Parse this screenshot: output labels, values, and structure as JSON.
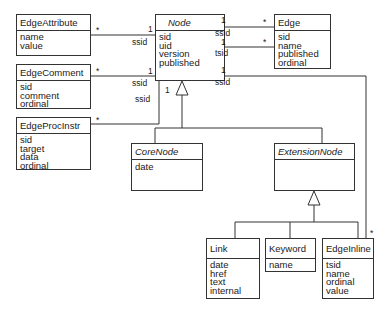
{
  "diagram": {
    "type": "uml-class-diagram",
    "classes": [
      {
        "id": "EdgeAttribute",
        "name": "EdgeAttribute",
        "abstract": false,
        "attributes": [
          "name",
          "value"
        ]
      },
      {
        "id": "EdgeComment",
        "name": "EdgeComment",
        "abstract": false,
        "attributes": [
          "sid",
          "comment",
          "ordinal"
        ]
      },
      {
        "id": "EdgeProcInstr",
        "name": "EdgeProcInstr",
        "abstract": false,
        "attributes": [
          "sid",
          "target",
          "data",
          "ordinal"
        ]
      },
      {
        "id": "Node",
        "name": "Node",
        "abstract": true,
        "attributes": [
          "sid",
          "uid",
          "version",
          "published"
        ]
      },
      {
        "id": "Edge",
        "name": "Edge",
        "abstract": false,
        "attributes": [
          "sid",
          "name",
          "published",
          "ordinal"
        ]
      },
      {
        "id": "CoreNode",
        "name": "CoreNode",
        "abstract": true,
        "attributes": [
          "date"
        ]
      },
      {
        "id": "ExtensionNode",
        "name": "ExtensionNode",
        "abstract": true,
        "attributes": []
      },
      {
        "id": "Link",
        "name": "Link",
        "abstract": false,
        "attributes": [
          "date",
          "href",
          "text",
          "internal"
        ]
      },
      {
        "id": "Keyword",
        "name": "Keyword",
        "abstract": false,
        "attributes": [
          "name"
        ]
      },
      {
        "id": "EdgeInline",
        "name": "EdgeInline",
        "abstract": false,
        "attributes": [
          "tsid",
          "name",
          "ordinal",
          "value"
        ]
      }
    ],
    "associations": [
      {
        "from": "EdgeAttribute",
        "to": "Node",
        "from_mult": "*",
        "to_mult": "1",
        "role": "ssid"
      },
      {
        "from": "EdgeComment",
        "to": "Node",
        "from_mult": "*",
        "to_mult": "1",
        "role": "ssid"
      },
      {
        "from": "EdgeProcInstr",
        "to": "Node",
        "from_mult": "*",
        "to_mult": "1",
        "role": "ssid"
      },
      {
        "from": "Node",
        "to": "Edge",
        "from_mult": "1",
        "to_mult": "*",
        "role": "ssid"
      },
      {
        "from": "Node",
        "to": "Edge",
        "from_mult": "1",
        "to_mult": "*",
        "role": "tsid"
      },
      {
        "from": "Node",
        "to": "EdgeInline",
        "from_mult": "1",
        "to_mult": "*",
        "role": "ssid"
      }
    ],
    "generalizations": [
      {
        "parent": "Node",
        "children": [
          "CoreNode",
          "ExtensionNode"
        ]
      },
      {
        "parent": "ExtensionNode",
        "children": [
          "Link",
          "Keyword",
          "EdgeInline"
        ]
      }
    ]
  },
  "labels": {
    "one": "1",
    "many": "*",
    "ssid": "ssid",
    "tsid": "tsid"
  }
}
